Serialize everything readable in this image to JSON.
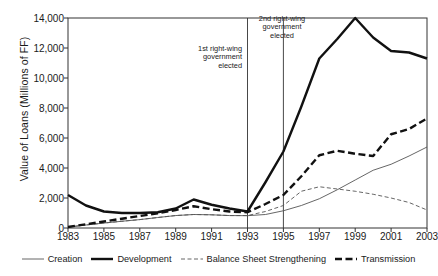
{
  "chart_data": {
    "type": "line",
    "title": "",
    "xlabel": "",
    "ylabel": "Value of Loans (Millions of FF)",
    "xlim": [
      1983,
      2003
    ],
    "ylim": [
      0,
      14000
    ],
    "ytick_labels": [
      "0",
      "2,000",
      "4,000",
      "6,000",
      "8,000",
      "10,000",
      "12,000",
      "14,000"
    ],
    "ytick_values": [
      0,
      2000,
      4000,
      6000,
      8000,
      10000,
      12000,
      14000
    ],
    "xtick_labels": [
      "1983",
      "1985",
      "1987",
      "1989",
      "1991",
      "1993",
      "1995",
      "1997",
      "1999",
      "2001",
      "2003"
    ],
    "xtick_values": [
      1983,
      1985,
      1987,
      1989,
      1991,
      1993,
      1995,
      1997,
      1999,
      2001,
      2003
    ],
    "grid": false,
    "legend_position": "bottom",
    "x": [
      1983,
      1984,
      1985,
      1986,
      1987,
      1988,
      1989,
      1990,
      1991,
      1992,
      1993,
      1994,
      1995,
      1996,
      1997,
      1998,
      1999,
      2000,
      2001,
      2002,
      2003
    ],
    "series": [
      {
        "name": "Creation",
        "style": "thin-solid",
        "color": "#555555",
        "values": [
          60,
          200,
          330,
          450,
          560,
          700,
          830,
          900,
          880,
          830,
          820,
          900,
          1150,
          1500,
          1950,
          2550,
          3200,
          3850,
          4250,
          4800,
          5400
        ]
      },
      {
        "name": "Development",
        "style": "thick-solid",
        "color": "#111111",
        "values": [
          2200,
          1500,
          1100,
          1000,
          1000,
          1050,
          1300,
          1900,
          1550,
          1300,
          1100,
          3050,
          5100,
          8100,
          11300,
          12600,
          14000,
          12700,
          11800,
          11700,
          11300
        ]
      },
      {
        "name": "Balance Sheet Strengthening",
        "style": "thin-dashed",
        "color": "#555555",
        "values": [
          60,
          200,
          330,
          450,
          560,
          700,
          830,
          900,
          880,
          830,
          830,
          1100,
          1500,
          2450,
          2750,
          2600,
          2450,
          2250,
          2000,
          1700,
          1200
        ]
      },
      {
        "name": "Transmission",
        "style": "thick-dashed",
        "color": "#111111",
        "values": [
          70,
          250,
          430,
          620,
          800,
          980,
          1200,
          1450,
          1250,
          1100,
          1050,
          1600,
          2200,
          3450,
          4850,
          5150,
          4950,
          4800,
          6250,
          6600,
          7300
        ]
      }
    ],
    "annotations": [
      {
        "id": "annot-1",
        "text": "1st right-wing\ngovernment\nelected",
        "x_value": 1993
      },
      {
        "id": "annot-2",
        "text": "2nd right-wing\ngovernment\nelected",
        "x_value": 1995
      }
    ]
  }
}
